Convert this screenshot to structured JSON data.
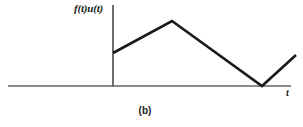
{
  "figure": {
    "caption": "(b)",
    "y_axis_label": "f(t)u(t)",
    "x_axis_label": "t",
    "curve_color": "#1a1a1a",
    "axis_color": "#808080",
    "background_color": "#ffffff"
  },
  "chart_data": {
    "type": "line",
    "title": "",
    "subtitle": "",
    "xlabel": "t",
    "ylabel": "f(t)u(t)",
    "caption": "(b)",
    "grid": false,
    "legend": "none",
    "xlim": [
      -0.58,
      1.23
    ],
    "ylim": [
      0,
      1
    ],
    "axis_origin_px": [
      113,
      86
    ],
    "series": [
      {
        "name": "f(t)u(t)",
        "x": [
          0,
          0.32,
          0.82,
          1.0
        ],
        "y": [
          0.5,
          1.0,
          0.0,
          0.47
        ],
        "points_px": [
          [
            113,
            53
          ],
          [
            172,
            21
          ],
          [
            262,
            86
          ],
          [
            296,
            55
          ]
        ],
        "description": "Piecewise-linear waveform: starts at a positive value on the vertical axis, rises to a peak, falls linearly to zero touching the horizontal axis, then rises again."
      }
    ],
    "annotations": [
      {
        "text": "f(t)u(t)",
        "role": "y-axis-label"
      },
      {
        "text": "t",
        "role": "x-axis-label"
      },
      {
        "text": "(b)",
        "role": "figure-caption"
      }
    ]
  }
}
